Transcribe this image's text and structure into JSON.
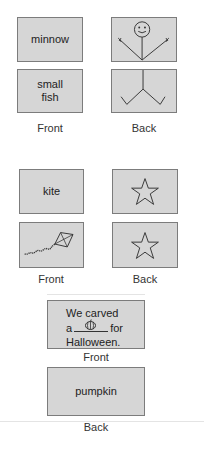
{
  "colors": {
    "card_fill": "#d6d6d6",
    "card_border": "#7c7c7c",
    "ink": "#222222",
    "divider": "#e4e4e4"
  },
  "sets": [
    {
      "name": "minnow",
      "cards": [
        {
          "side": "front",
          "text": "minnow"
        },
        {
          "side": "front",
          "text": "small fish"
        },
        {
          "side": "back",
          "image": "stick-figure-top"
        },
        {
          "side": "back",
          "image": "stick-figure-bottom"
        }
      ],
      "labels": {
        "front": "Front",
        "back": "Back"
      }
    },
    {
      "name": "kite",
      "cards": [
        {
          "side": "front",
          "text": "kite"
        },
        {
          "side": "front",
          "image": "kite-icon"
        },
        {
          "side": "back",
          "image": "star-icon"
        },
        {
          "side": "back",
          "image": "star-icon"
        }
      ],
      "labels": {
        "front": "Front",
        "back": "Back"
      }
    },
    {
      "name": "pumpkin",
      "cards": [
        {
          "side": "front",
          "sentence": {
            "line1": "We carved",
            "line2_pre": "a",
            "blank_icon": "pumpkin-icon",
            "line2_post": "for",
            "line3": "Halloween."
          }
        },
        {
          "side": "back",
          "text": "pumpkin"
        }
      ],
      "labels": {
        "front": "Front",
        "back": "Back"
      }
    }
  ]
}
